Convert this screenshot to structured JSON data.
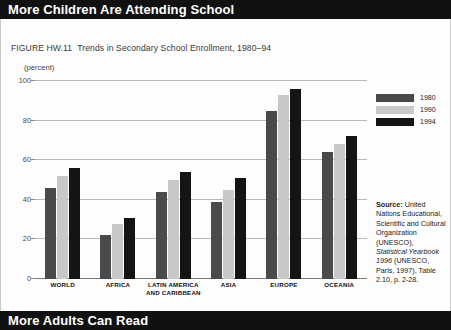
{
  "top_banner": {
    "title": "More Children Are Attending School"
  },
  "bottom_banner": {
    "title": "More Adults Can Read"
  },
  "caption": {
    "figure_number": "FIGURE HW.11",
    "text": "Trends in Secondary School Enrollment, 1980–94"
  },
  "axis": {
    "unit_label": "(percent)",
    "y_ticks": [
      "100",
      "80",
      "60",
      "40",
      "20",
      "0"
    ]
  },
  "legend": {
    "items": [
      {
        "label": "1980",
        "color": "#4a4a4a"
      },
      {
        "label": "1990",
        "color": "#c8c8c8"
      },
      {
        "label": "1994",
        "color": "#141414"
      }
    ]
  },
  "source": {
    "heading": "Source:",
    "body_1": " United Nations Educational, Scientific and Cultural Organization (UNESCO), ",
    "italic": "Statistical Yearbook 1996",
    "body_2": " (UNESCO, Paris, 1997), Table 2.10, p. 2-28."
  },
  "categories_display": [
    {
      "line1": "WORLD",
      "line2": ""
    },
    {
      "line1": "AFRICA",
      "line2": ""
    },
    {
      "line1": "LATIN AMERICA",
      "line2": "AND CARIBBEAN"
    },
    {
      "line1": "ASIA",
      "line2": ""
    },
    {
      "line1": "EUROPE",
      "line2": ""
    },
    {
      "line1": "OCEANIA",
      "line2": ""
    }
  ],
  "chart_data": {
    "type": "bar",
    "title": "More Children Are Attending School",
    "subtitle": "FIGURE HW.11  Trends in Secondary School Enrollment, 1980–94",
    "xlabel": "",
    "ylabel": "(percent)",
    "ylim": [
      0,
      100
    ],
    "yticks": [
      0,
      20,
      40,
      60,
      80,
      100
    ],
    "grid": true,
    "legend_position": "right",
    "categories": [
      "WORLD",
      "AFRICA",
      "LATIN AMERICA AND CARIBBEAN",
      "ASIA",
      "EUROPE",
      "OCEANIA"
    ],
    "series": [
      {
        "name": "1980",
        "color": "#4a4a4a",
        "values": [
          46,
          22,
          44,
          39,
          85,
          64
        ]
      },
      {
        "name": "1990",
        "color": "#c8c8c8",
        "values": [
          52,
          28,
          50,
          45,
          93,
          68
        ]
      },
      {
        "name": "1994",
        "color": "#141414",
        "values": [
          56,
          31,
          54,
          51,
          96,
          72
        ]
      }
    ],
    "source": "United Nations Educational, Scientific and Cultural Organization (UNESCO), Statistical Yearbook 1996 (UNESCO, Paris, 1997), Table 2.10, p. 2-28."
  }
}
